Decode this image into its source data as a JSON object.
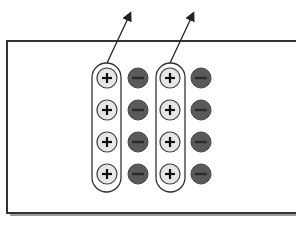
{
  "diagram": {
    "colors": {
      "background": "#ffffff",
      "border": "#333333",
      "shadow": "#9a9a9a",
      "positive_fill": "#e6e6e6",
      "positive_stroke": "#444444",
      "negative_fill": "#5a5a5a",
      "negative_stroke": "#444444",
      "sign_color": "#111111",
      "arrow": "#222222"
    },
    "region": {
      "x": 7,
      "y": 41,
      "width": 300,
      "height": 172
    },
    "groups": [
      {
        "id": "group-1",
        "pill": {
          "x": 92,
          "y": 63,
          "w": 29,
          "h": 129
        },
        "positive_x": 107,
        "negative_x": 138,
        "arrow": {
          "from": [
            107,
            63
          ],
          "to": [
            130,
            14
          ]
        }
      },
      {
        "id": "group-2",
        "pill": {
          "x": 156,
          "y": 63,
          "w": 29,
          "h": 129
        },
        "positive_x": 170,
        "negative_x": 201,
        "arrow": {
          "from": [
            170,
            63
          ],
          "to": [
            193,
            14
          ]
        }
      }
    ],
    "rows_y": [
      78,
      110,
      142,
      174
    ],
    "charge_radius": 10,
    "positive_symbol": "+",
    "negative_symbol": "−",
    "counts": {
      "positive_charges": 8,
      "negative_charges": 8
    }
  }
}
